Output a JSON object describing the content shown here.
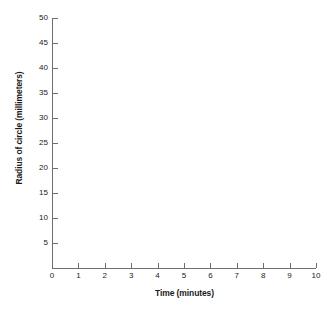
{
  "chart_data": {
    "type": "line",
    "title": "",
    "subtitle": "",
    "xlabel": "Time (minutes)",
    "ylabel": "Radius of circle (millimeters)",
    "x": [],
    "values": [],
    "series": [],
    "xlim": [
      0,
      10
    ],
    "ylim": [
      0,
      50
    ],
    "x_ticks": [
      0,
      1,
      2,
      3,
      4,
      5,
      6,
      7,
      8,
      9,
      10
    ],
    "x_tick_labels": [
      "0",
      "1",
      "2",
      "3",
      "4",
      "5",
      "6",
      "7",
      "8",
      "9",
      "10"
    ],
    "y_ticks": [
      5,
      10,
      15,
      20,
      25,
      30,
      35,
      40,
      45,
      50
    ],
    "y_tick_labels": [
      "5",
      "10",
      "15",
      "20",
      "25",
      "30",
      "35",
      "40",
      "45",
      "50"
    ],
    "grid": false,
    "legend": false,
    "legend_position": "none",
    "annotations": [],
    "note": "Empty plotting grid - no data points drawn",
    "colors": {
      "background": "#ffffff",
      "axis": "#6e6e6e",
      "text": "#1a1a1a"
    }
  }
}
